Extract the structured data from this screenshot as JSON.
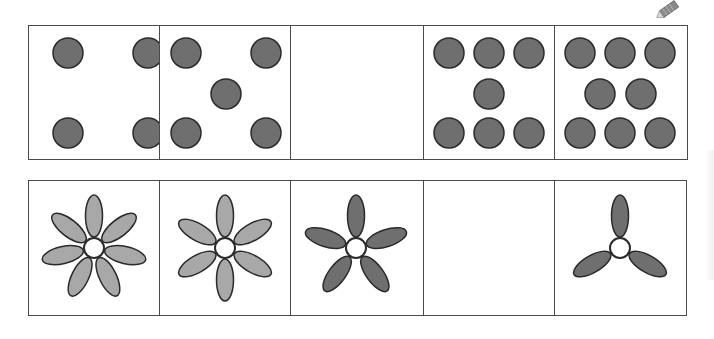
{
  "colors": {
    "border": "#4a4a4a",
    "dot_fill": "#6f6f6f",
    "petal_light": "#a8a8a8",
    "petal_dark": "#6f6f6f",
    "center_fill": "#ffffff",
    "outline": "#2a2a2a"
  },
  "icons": {
    "pencil": "pencil-icon"
  },
  "dot_row": {
    "cells": [
      {
        "label": "4 dots",
        "count": 4,
        "dots": [
          [
            39,
            27
          ],
          [
            119,
            27
          ],
          [
            39,
            107
          ],
          [
            119,
            107
          ]
        ]
      },
      {
        "label": "5 dots",
        "count": 5,
        "dots": [
          [
            26,
            27
          ],
          [
            106,
            27
          ],
          [
            66,
            68
          ],
          [
            26,
            107
          ],
          [
            106,
            107
          ]
        ]
      },
      {
        "label": "empty (missing)",
        "count": null,
        "dots": []
      },
      {
        "label": "7 dots",
        "count": 7,
        "dots": [
          [
            25,
            27
          ],
          [
            65,
            27
          ],
          [
            105,
            27
          ],
          [
            65,
            68
          ],
          [
            25,
            107
          ],
          [
            65,
            107
          ],
          [
            105,
            107
          ]
        ]
      },
      {
        "label": "8 dots",
        "count": 8,
        "dots": [
          [
            25,
            27
          ],
          [
            65,
            27
          ],
          [
            105,
            27
          ],
          [
            45,
            68
          ],
          [
            86,
            68
          ],
          [
            25,
            107
          ],
          [
            65,
            107
          ],
          [
            105,
            107
          ]
        ]
      }
    ]
  },
  "flower_row": {
    "cells": [
      {
        "label": "7 petals",
        "petals": 7,
        "shade": "light",
        "rotation": 0
      },
      {
        "label": "6 petals",
        "petals": 6,
        "shade": "light",
        "rotation": 0
      },
      {
        "label": "5 petals",
        "petals": 5,
        "shade": "dark",
        "rotation": 0
      },
      {
        "label": "empty (missing)",
        "petals": 0,
        "shade": "none",
        "rotation": 0
      },
      {
        "label": "3 petals",
        "petals": 3,
        "shade": "dark",
        "rotation": 0
      }
    ]
  }
}
